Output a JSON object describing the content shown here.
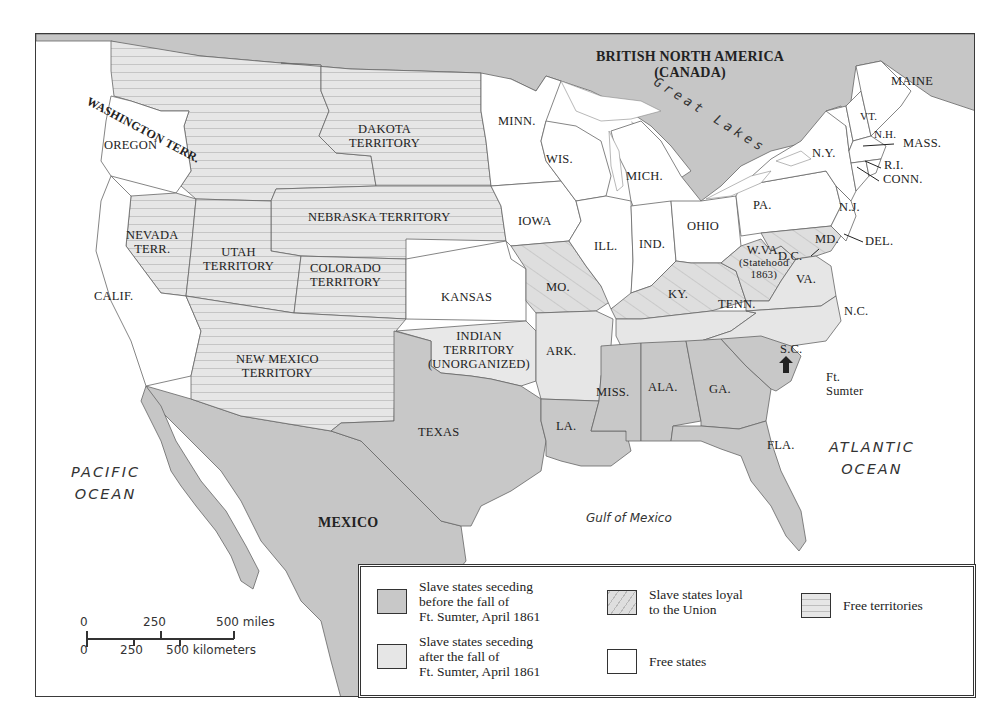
{
  "map": {
    "title_region": "British North America (Canada) map of US, 1861",
    "colors": {
      "seceded_before": "#c8c8c8",
      "seceded_after": "#e6e6e6",
      "loyal_slave": "#dcdcdc",
      "free_state": "#ffffff",
      "free_territory": "#e4e4e4",
      "foreign": "#c4c4c4",
      "border": "#555555"
    },
    "labels": {
      "canada_line1": "BRITISH NORTH AMERICA",
      "canada_line2": "(CANADA)",
      "great_lakes": "Great Lakes",
      "mexico": "MEXICO",
      "pacific_1": "PACIFIC",
      "pacific_2": "OCEAN",
      "atlantic_1": "ATLANTIC",
      "atlantic_2": "OCEAN",
      "gulf": "Gulf of Mexico",
      "washington": "WASHINGTON TERR.",
      "oregon": "OREGON",
      "dakota_1": "DAKOTA",
      "dakota_2": "TERRITORY",
      "minn": "MINN.",
      "wis": "WIS.",
      "mich": "MICH.",
      "maine": "MAINE",
      "vt": "VT.",
      "nh": "N.H.",
      "mass": "MASS.",
      "ri": "R.I.",
      "conn": "CONN.",
      "ny": "N.Y.",
      "nj": "N.J.",
      "pa": "PA.",
      "del": "DEL.",
      "md": "MD.",
      "dc": "D.C.",
      "ohio": "OHIO",
      "ind": "IND.",
      "ill": "ILL.",
      "iowa": "IOWA",
      "nebraska": "NEBRASKA TERRITORY",
      "nevada_1": "NEVADA",
      "nevada_2": "TERR.",
      "utah_1": "UTAH",
      "utah_2": "TERRITORY",
      "colorado_1": "COLORADO",
      "colorado_2": "TERRITORY",
      "calif": "CALIF.",
      "kansas": "KANSAS",
      "mo": "MO.",
      "ky": "KY.",
      "wva_1": "W.VA.",
      "wva_2": "(Statehood",
      "wva_3": "1863)",
      "va": "VA.",
      "nc": "N.C.",
      "tenn": "TENN.",
      "sc": "S.C.",
      "ft_sumter_1": "Ft.",
      "ft_sumter_2": "Sumter",
      "indian_1": "INDIAN",
      "indian_2": "TERRITORY",
      "indian_3": "(UNORGANIZED)",
      "ark": "ARK.",
      "newmexico_1": "NEW MEXICO",
      "newmexico_2": "TERRITORY",
      "texas": "TEXAS",
      "la": "LA.",
      "miss": "MISS.",
      "ala": "ALA.",
      "ga": "GA.",
      "fla": "FLA."
    }
  },
  "legend": {
    "items": [
      {
        "label": "Slave states seceding\nbefore the fall of\nFt. Sumter, April 1861",
        "pattern": "seceded_before"
      },
      {
        "label": "Slave states loyal\nto the Union",
        "pattern": "loyal_slave"
      },
      {
        "label": "Free territories",
        "pattern": "free_territory"
      },
      {
        "label": "Slave states seceding\nafter the fall of\nFt. Sumter, April 1861",
        "pattern": "seceded_after"
      },
      {
        "label": "Free states",
        "pattern": "free_state"
      }
    ]
  },
  "scale": {
    "miles": [
      "0",
      "250",
      "500 miles"
    ],
    "km": [
      "0",
      "250",
      "500 kilometers"
    ]
  }
}
